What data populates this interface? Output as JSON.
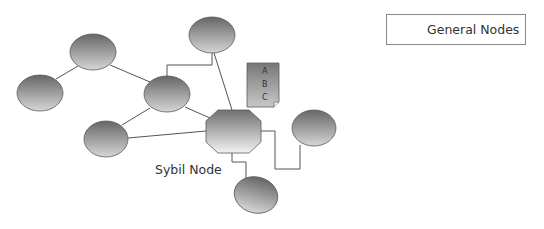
{
  "legend": {
    "label": "General Nodes",
    "swatch": "general-node"
  },
  "sybil_label": "Sybil Node",
  "document": {
    "lines": [
      "A",
      "B",
      "C"
    ]
  },
  "colors": {
    "node_dark": "#6a6a6a",
    "node_light": "#d8d8d8",
    "edge": "#555555",
    "text": "#333333"
  },
  "nodes": [
    {
      "id": "n1",
      "type": "general",
      "cx": 93,
      "cy": 52
    },
    {
      "id": "n2",
      "type": "general",
      "cx": 40,
      "cy": 93
    },
    {
      "id": "n3",
      "type": "general",
      "cx": 167,
      "cy": 94
    },
    {
      "id": "n4",
      "type": "general",
      "cx": 106,
      "cy": 139
    },
    {
      "id": "n5",
      "type": "general",
      "cx": 212,
      "cy": 35
    },
    {
      "id": "n6",
      "type": "general",
      "cx": 314,
      "cy": 128
    },
    {
      "id": "n7",
      "type": "general",
      "cx": 256,
      "cy": 195
    },
    {
      "id": "sybil",
      "type": "sybil",
      "cx": 233,
      "cy": 131
    }
  ],
  "edges": [
    [
      "n1",
      "n2"
    ],
    [
      "n1",
      "n3"
    ],
    [
      "n3",
      "n4"
    ],
    [
      "n3",
      "sybil"
    ],
    [
      "n4",
      "sybil"
    ],
    [
      "n5",
      "sybil"
    ],
    [
      "n5",
      "n3"
    ],
    [
      "sybil",
      "n6"
    ],
    [
      "sybil",
      "n7"
    ]
  ]
}
